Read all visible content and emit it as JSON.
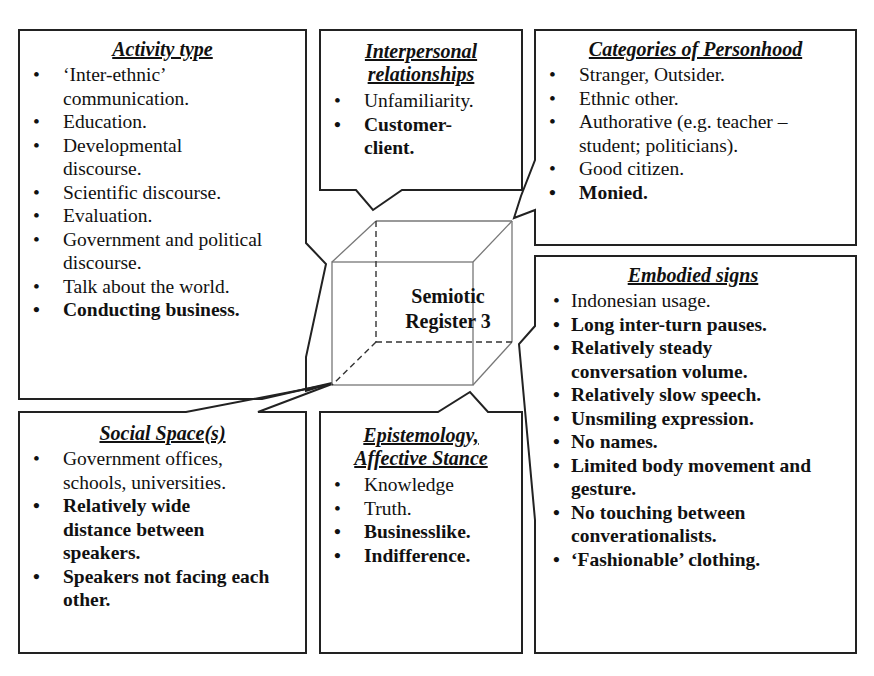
{
  "diagram": {
    "center_label": [
      "Semiotic",
      "Register 3"
    ],
    "colors": {
      "line": "#222222",
      "cube_line": "#777777",
      "background": "#ffffff"
    },
    "boxes": {
      "activity_type": {
        "title": "Activity type",
        "items": [
          {
            "text": "‘Inter-ethnic’ communication.",
            "bold": false
          },
          {
            "text": "Education.",
            "bold": false
          },
          {
            "text": "Developmental discourse.",
            "bold": false
          },
          {
            "text": "Scientific discourse.",
            "bold": false
          },
          {
            "text": "Evaluation.",
            "bold": false
          },
          {
            "text": "Government and political discourse.",
            "bold": false
          },
          {
            "text": "Talk about the world.",
            "bold": false
          },
          {
            "text": "Conducting business.",
            "bold": true
          }
        ]
      },
      "interpersonal": {
        "title_line1": "Interpersonal",
        "title_line2": "relationships",
        "items": [
          {
            "text": "Unfamiliarity.",
            "bold": false
          },
          {
            "text": "Customer-client.",
            "bold": true
          }
        ]
      },
      "personhood": {
        "title": "Categories of Personhood",
        "items": [
          {
            "text": "Stranger, Outsider.",
            "bold": false
          },
          {
            "text": "Ethnic other.",
            "bold": false
          },
          {
            "text": "Authorative (e.g. teacher – student; politicians).",
            "bold": false
          },
          {
            "text": "Good citizen.",
            "bold": false
          },
          {
            "text": "Monied.",
            "bold": true
          }
        ]
      },
      "embodied": {
        "title": "Embodied signs",
        "items": [
          {
            "text": "Indonesian usage.",
            "bold": false
          },
          {
            "text": "Long inter-turn pauses.",
            "bold": true
          },
          {
            "text": "Relatively steady conversation volume.",
            "bold": true
          },
          {
            "text": "Relatively slow speech.",
            "bold": true
          },
          {
            "text": "Unsmiling expression.",
            "bold": true
          },
          {
            "text": "No names.",
            "bold": true
          },
          {
            "text": "Limited body movement and gesture.",
            "bold": true
          },
          {
            "text": "No touching between converationalists.",
            "bold": true
          },
          {
            "text": "‘Fashionable’ clothing.",
            "bold": true
          }
        ]
      },
      "social_space": {
        "title": "Social Space(s)",
        "items": [
          {
            "text": "Government offices, schools, universities.",
            "bold": false
          },
          {
            "text": "Relatively wide distance between speakers.",
            "bold": true
          },
          {
            "text": "Speakers not facing each other.",
            "bold": true
          }
        ]
      },
      "epistemology": {
        "title_line1": "Epistemology,",
        "title_line2": "Affective Stance",
        "items": [
          {
            "text": "Knowledge",
            "bold": false
          },
          {
            "text": "Truth.",
            "bold": false
          },
          {
            "text": "Businesslike.",
            "bold": true
          },
          {
            "text": "Indifference.",
            "bold": true
          }
        ]
      }
    },
    "bullet_glyph": "•"
  }
}
